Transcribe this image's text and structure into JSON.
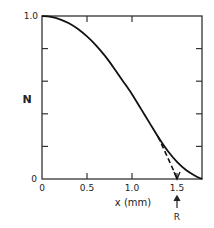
{
  "chart_data": {
    "type": "line",
    "title": "",
    "xlabel": "x (mm)",
    "ylabel": "N",
    "xlim": [
      0,
      1.78
    ],
    "ylim": [
      0,
      1.0
    ],
    "grid": false,
    "x_ticks": [
      0,
      0.5,
      1.0,
      1.5
    ],
    "x_tick_labels": [
      "0",
      "0.5",
      "1.0",
      "1.5"
    ],
    "y_ticks": [
      0,
      0.2,
      0.4,
      0.6,
      0.8,
      1.0
    ],
    "y_tick_labels": [
      "0",
      "",
      "",
      "",
      "",
      "1.0"
    ],
    "series": [
      {
        "name": "N(x)",
        "style": "solid",
        "x": [
          0,
          0.1,
          0.2,
          0.3,
          0.4,
          0.5,
          0.6,
          0.7,
          0.8,
          0.9,
          1.0,
          1.1,
          1.2,
          1.3,
          1.4,
          1.5,
          1.6,
          1.7,
          1.78
        ],
        "y": [
          1.0,
          0.995,
          0.98,
          0.955,
          0.92,
          0.875,
          0.82,
          0.755,
          0.68,
          0.6,
          0.52,
          0.43,
          0.34,
          0.25,
          0.17,
          0.105,
          0.055,
          0.02,
          0.0
        ]
      },
      {
        "name": "tangent extrapolation",
        "style": "dashed",
        "x": [
          1.29,
          1.5
        ],
        "y": [
          0.26,
          0.0
        ]
      }
    ],
    "annotations": [
      {
        "text": "R",
        "x": 1.5,
        "marker": "up-arrow below x-axis"
      }
    ]
  },
  "labels": {
    "y_axis": "N",
    "x_axis": "x (mm)",
    "y_top": "1.0",
    "y_bottom": "0",
    "x0": "0",
    "x05": "0.5",
    "x10": "1.0",
    "x15": "1.5",
    "r_marker": "R"
  }
}
